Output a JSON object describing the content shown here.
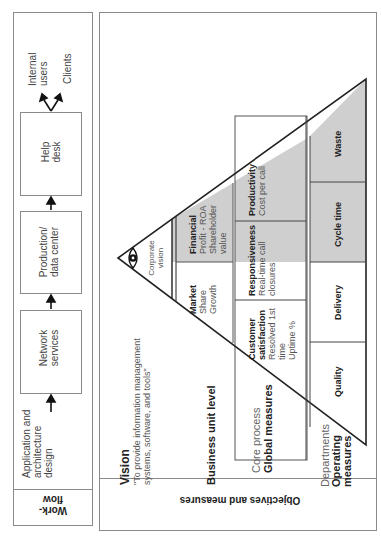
{
  "workflow": {
    "header": "Work-\nflow",
    "steps": [
      {
        "label": "Application and architecture design"
      },
      {
        "label": "Network services"
      },
      {
        "label": "Production/ data center"
      },
      {
        "label": "Help desk"
      }
    ],
    "outputs": [
      "Internal users",
      "Clients"
    ]
  },
  "objectives": {
    "header": "Objectives and measures",
    "vision": {
      "title": "Vision",
      "line1": "\"To provide information management",
      "line2": "systems, software, and tools\""
    },
    "levels": {
      "business": "Business unit level",
      "core_process_light": "Core process",
      "core_process_bold": "Global measures",
      "departments_light": "Departments",
      "departments_bold1": "Operating",
      "departments_bold2": "measures"
    },
    "pyramid": {
      "apex": "Corporate vision",
      "apex_line1": "Corporate",
      "apex_line2": "vision",
      "business_cells": [
        {
          "title": "Financial",
          "lines": [
            "Profit - ROA",
            "Shareholder",
            "value"
          ],
          "shaded": true
        },
        {
          "title": "Market",
          "lines": [
            "Share",
            "Growth"
          ],
          "shaded": false
        }
      ],
      "core_cells": [
        {
          "title": "Productivity",
          "lines": [
            "Cost per call"
          ],
          "shaded": true
        },
        {
          "title": "Responsiveness",
          "lines": [
            "Real-time call",
            "closures"
          ],
          "shaded": "partial"
        },
        {
          "title": "Customer",
          "title2": "satisfaction",
          "lines": [
            "Resolved 1st",
            "time",
            "Uptime %"
          ],
          "shaded": false
        }
      ],
      "operating_cells": [
        {
          "title": "Waste",
          "shaded": true
        },
        {
          "title": "Cycle time",
          "shaded": true
        },
        {
          "title": "Delivery",
          "shaded": false
        },
        {
          "title": "Quality",
          "shaded": false
        }
      ]
    },
    "colors": {
      "shade": "#cfcfcf",
      "line": "#333333",
      "border": "#8a8a8a"
    }
  }
}
